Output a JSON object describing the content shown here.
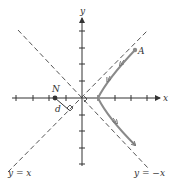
{
  "axes": {
    "x_label": "x",
    "y_label": "y"
  },
  "asymptotes": {
    "line1_label": "y = x",
    "line2_label": "y = −x"
  },
  "points": {
    "A_label": "A",
    "N_label": "N"
  },
  "distance_label": "d",
  "colors": {
    "axis": "#333333",
    "asymptote": "#555555",
    "curve": "#8a8a8a",
    "text": "#333333"
  }
}
